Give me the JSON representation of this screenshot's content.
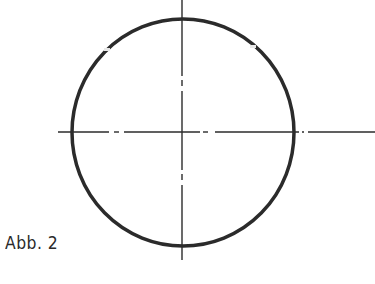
{
  "figure": {
    "caption": "Abb. 2",
    "colors": {
      "stroke": "#2b2b2b",
      "background": "#ffffff"
    },
    "circle": {
      "cx": 182,
      "cy": 132,
      "rx": 111,
      "ry": 113,
      "stroke_width": 3.5
    },
    "center_lines": {
      "horizontal": {
        "y": 132,
        "x_start": 58,
        "x_end": 375,
        "style": "dash-dot"
      },
      "vertical": {
        "x": 182,
        "y_start": 0,
        "y_end": 260,
        "style": "dash-dot"
      }
    }
  }
}
